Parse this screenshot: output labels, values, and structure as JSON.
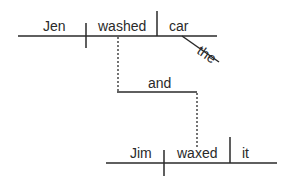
{
  "diagram": {
    "type": "sentence-diagram",
    "sentence1": {
      "subject": "Jen",
      "verb": "washed",
      "object": "car",
      "modifier": "the"
    },
    "conjunction": "and",
    "sentence2": {
      "subject": "Jim",
      "verb": "waxed",
      "object": "it"
    },
    "line_color": "#2a2a2a"
  }
}
